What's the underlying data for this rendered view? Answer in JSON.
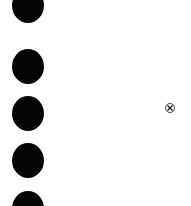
{
  "dots": {
    "count": 5,
    "color": "#050505",
    "positions_top": [
      -1,
      49,
      96,
      143,
      191
    ]
  },
  "icons": {
    "close": "circled-x-icon"
  }
}
